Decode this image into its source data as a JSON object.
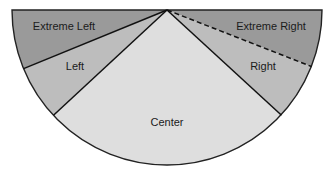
{
  "diagram": {
    "type": "semicircle-sectors",
    "segments": [
      {
        "id": "extreme-left",
        "label": "Extreme Left",
        "color": "#9a9a9a"
      },
      {
        "id": "left",
        "label": "Left",
        "color": "#bdbdbd"
      },
      {
        "id": "center",
        "label": "Center",
        "color": "#dedede"
      },
      {
        "id": "right",
        "label": "Right",
        "color": "#bdbdbd"
      },
      {
        "id": "extreme-right",
        "label": "Extreme Right",
        "color": "#9a9a9a"
      }
    ],
    "boundaries": [
      {
        "between": [
          "extreme-left",
          "left"
        ],
        "style": "solid"
      },
      {
        "between": [
          "left",
          "center"
        ],
        "style": "solid"
      },
      {
        "between": [
          "center",
          "right"
        ],
        "style": "solid"
      },
      {
        "between": [
          "right",
          "extreme-right"
        ],
        "style": "dashed"
      }
    ]
  }
}
